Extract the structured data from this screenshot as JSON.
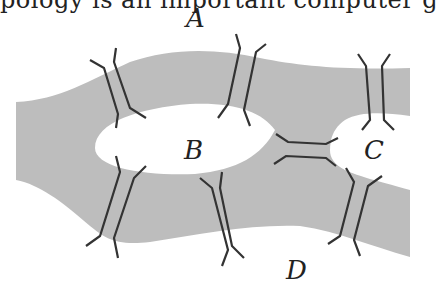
{
  "header_text": "pology is an important computer g",
  "diagram": {
    "labels": {
      "a": "A",
      "b": "B",
      "c": "C",
      "d": "D"
    },
    "colors": {
      "water": "#bdbdbd",
      "land": "#ffffff",
      "bridge": "#333333"
    },
    "bridge_count": 7
  }
}
